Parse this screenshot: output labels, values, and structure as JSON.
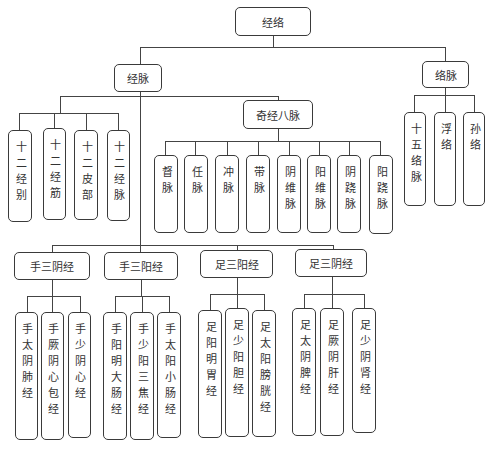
{
  "diagram": {
    "root": {
      "label": "经络"
    },
    "level1": [
      {
        "id": "jingmai",
        "label": "经脉"
      },
      {
        "id": "luomai",
        "label": "络脉"
      }
    ],
    "jingmai_children": {
      "twelve": [
        {
          "label": "十二经别"
        },
        {
          "label": "十二经筋"
        },
        {
          "label": "十二皮部"
        },
        {
          "label": "十二经脉"
        }
      ],
      "qijing": {
        "label": "奇经八脉",
        "children": [
          {
            "label": "督脉"
          },
          {
            "label": "任脉"
          },
          {
            "label": "冲脉"
          },
          {
            "label": "带脉"
          },
          {
            "label": "阴维脉"
          },
          {
            "label": "阳维脉"
          },
          {
            "label": "阴跷脉"
          },
          {
            "label": "阳跷脉"
          }
        ]
      },
      "groups": [
        {
          "label": "手三阴经",
          "children": [
            {
              "label": "手太阴肺经"
            },
            {
              "label": "手厥阴心包经"
            },
            {
              "label": "手少阴心经"
            }
          ]
        },
        {
          "label": "手三阳经",
          "children": [
            {
              "label": "手阳明大肠经"
            },
            {
              "label": "手少阳三焦经"
            },
            {
              "label": "手太阳小肠经"
            }
          ]
        },
        {
          "label": "足三阳经",
          "children": [
            {
              "label": "足阳明胃经"
            },
            {
              "label": "足少阳胆经"
            },
            {
              "label": "足太阳膀胱经"
            }
          ]
        },
        {
          "label": "足三阴经",
          "children": [
            {
              "label": "足太阴脾经"
            },
            {
              "label": "足厥阴肝经"
            },
            {
              "label": "足少阴肾经"
            }
          ]
        }
      ]
    },
    "luomai_children": [
      {
        "label": "十五络脉"
      },
      {
        "label": "浮络"
      },
      {
        "label": "孙络"
      }
    ],
    "colors": {
      "line": "#444444",
      "border": "#3a3a3a",
      "text": "#333333",
      "background": "#ffffff"
    }
  }
}
